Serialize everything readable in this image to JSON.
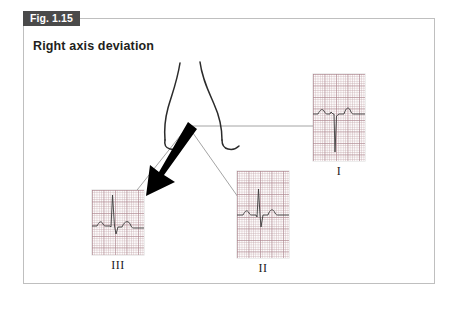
{
  "figure": {
    "tab_label": "Fig. 1.15",
    "heading": "Right axis deviation",
    "border_color": "#bfbfbf",
    "tab_bg_color": "#4a4a4a",
    "tab_text_color": "#ffffff",
    "background_color": "#ffffff"
  },
  "diagram": {
    "torso_label": "torso-outline",
    "axis_arrow": {
      "name": "qrs-axis-vector-arrow",
      "color": "#000000",
      "direction": "down-left",
      "description": "Bold black mean QRS axis vector pointing inferior and to the patient's left of image (rightward axis)"
    },
    "lead_line_color": "#9a9a9a",
    "waveform_color": "#3a3a3a",
    "grid_color": "#aa828c"
  },
  "leads": [
    {
      "id": "lead-i",
      "label": "I",
      "morphology": "deep negative S wave (predominantly negative QRS)",
      "strip": {
        "left": 313,
        "top": 74,
        "width": 52,
        "height": 87
      },
      "label_pos": {
        "left": 313,
        "top": 164,
        "width": 52
      }
    },
    {
      "id": "lead-ii",
      "label": "II",
      "morphology": "biphasic QRS, small R with S wave",
      "strip": {
        "left": 237,
        "top": 171,
        "width": 52,
        "height": 87
      },
      "label_pos": {
        "left": 237,
        "top": 261,
        "width": 52
      }
    },
    {
      "id": "lead-iii",
      "label": "III",
      "morphology": "tall positive R wave (predominantly positive QRS)",
      "strip": {
        "left": 92,
        "top": 190,
        "width": 52,
        "height": 65
      },
      "label_pos": {
        "left": 92,
        "top": 258,
        "width": 52
      }
    }
  ]
}
